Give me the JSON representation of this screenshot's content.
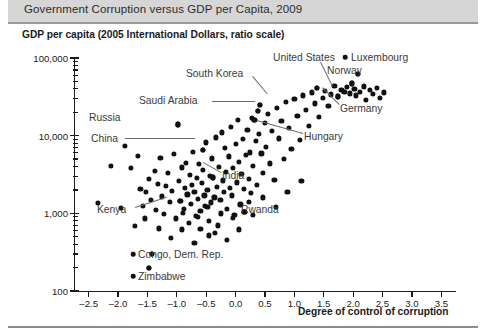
{
  "chart_data": {
    "type": "scatter",
    "title": "Government Corruption versus GDP per Capita, 2009",
    "ylabel": "GDP per capita (2005 International Dollars, ratio scale)",
    "xlabel": "Degree of control of corruption",
    "yscale": "log",
    "xlim": [
      -2.75,
      3.75
    ],
    "ylim": [
      100,
      100000
    ],
    "grid": false,
    "legend": null,
    "xticks": [
      -2.5,
      -2.0,
      -1.5,
      -1.0,
      -0.5,
      0.0,
      0.5,
      1.0,
      1.5,
      2.0,
      2.5,
      3.0,
      3.5
    ],
    "xticklabels": [
      "–2.5",
      "–2.0",
      "–1.5",
      "–1.0",
      "–0.5",
      "0.0",
      "0.5",
      "1.0",
      "1.5",
      "2.0",
      "2.5",
      "3.0",
      "3.5"
    ],
    "yticks": [
      100,
      1000,
      10000,
      100000
    ],
    "yticklabels": [
      "100",
      "1,000",
      "10,000",
      "100,000"
    ],
    "point_color": "#111111",
    "annotation_color": "#3a3a3a",
    "annotations": [
      {
        "label": "United States",
        "x": 1.38,
        "y": 41000,
        "text_x": 273,
        "text_y": 52,
        "leader": [
          321,
          62,
          333,
          86
        ]
      },
      {
        "label": "Luxembourg",
        "x": 2.08,
        "y": 62000,
        "text_x": 351,
        "text_y": 52,
        "leader": null,
        "marker": [
          345,
          57
        ]
      },
      {
        "label": "Norway",
        "x": 1.98,
        "y": 47000,
        "text_x": 327,
        "text_y": 65,
        "leader": null
      },
      {
        "label": "Germany",
        "x": 1.74,
        "y": 32000,
        "text_x": 340,
        "text_y": 103,
        "leader": [
          339,
          105,
          322,
          88
        ]
      },
      {
        "label": "South Korea",
        "x": 0.42,
        "y": 25000,
        "text_x": 186,
        "text_y": 68,
        "leader": [
          253,
          76,
          268,
          94
        ]
      },
      {
        "label": "Saudi Arabia",
        "x": 0.38,
        "y": 21000,
        "text_x": 139,
        "text_y": 95,
        "leader": [
          212,
          101,
          255,
          101
        ]
      },
      {
        "label": "Russia",
        "x": -0.98,
        "y": 14000,
        "text_x": 89,
        "text_y": 112,
        "leader": null
      },
      {
        "label": "China",
        "x": -0.55,
        "y": 6500,
        "text_x": 91,
        "text_y": 133,
        "leader": [
          125,
          138,
          195,
          138
        ]
      },
      {
        "label": "Hungary",
        "x": 0.32,
        "y": 16000,
        "text_x": 304,
        "text_y": 131,
        "leader": [
          303,
          134,
          257,
          121
        ]
      },
      {
        "label": "India",
        "x": -0.38,
        "y": 2900,
        "text_x": 222,
        "text_y": 170,
        "leader": [
          221,
          173,
          203,
          163
        ]
      },
      {
        "label": "Kenya",
        "x": -0.95,
        "y": 1450,
        "text_x": 97,
        "text_y": 204,
        "leader": [
          135,
          207,
          166,
          197
        ]
      },
      {
        "label": "Rwanda",
        "x": 0.15,
        "y": 1050,
        "text_x": 241,
        "text_y": 204,
        "leader": null
      },
      {
        "label": "Congo, Dem. Rep.",
        "x": -1.42,
        "y": 300,
        "text_x": 138,
        "text_y": 249,
        "leader": null,
        "marker": [
          133,
          254
        ]
      },
      {
        "label": "Zimbabwe",
        "x": -1.48,
        "y": 200,
        "text_x": 138,
        "text_y": 271,
        "leader": null,
        "marker": [
          133,
          276
        ]
      }
    ],
    "points": [
      [
        -2.12,
        4100
      ],
      [
        -1.88,
        7400
      ],
      [
        -1.72,
        690
      ],
      [
        -1.62,
        2050
      ],
      [
        -1.58,
        1250
      ],
      [
        -1.52,
        1900
      ],
      [
        -1.48,
        2750
      ],
      [
        -1.44,
        1500
      ],
      [
        -1.42,
        300
      ],
      [
        -1.48,
        200
      ],
      [
        -1.38,
        3500
      ],
      [
        -1.35,
        1120
      ],
      [
        -1.32,
        2400
      ],
      [
        -1.28,
        5200
      ],
      [
        -1.25,
        1650
      ],
      [
        -1.22,
        980
      ],
      [
        -1.18,
        2250
      ],
      [
        -1.15,
        3300
      ],
      [
        -1.12,
        1400
      ],
      [
        -1.08,
        1950
      ],
      [
        -1.05,
        5800
      ],
      [
        -1.02,
        860
      ],
      [
        -0.98,
        14000
      ],
      [
        -0.96,
        2600
      ],
      [
        -0.94,
        1450
      ],
      [
        -0.92,
        3900
      ],
      [
        -0.88,
        1150
      ],
      [
        -0.86,
        2100
      ],
      [
        -0.84,
        4500
      ],
      [
        -0.82,
        1750
      ],
      [
        -0.8,
        760
      ],
      [
        -0.78,
        3100
      ],
      [
        -0.76,
        1320
      ],
      [
        -0.74,
        2300
      ],
      [
        -0.72,
        6200
      ],
      [
        -0.7,
        1880
      ],
      [
        -0.68,
        920
      ],
      [
        -0.66,
        2850
      ],
      [
        -0.64,
        1550
      ],
      [
        -0.62,
        4300
      ],
      [
        -0.6,
        1080
      ],
      [
        -0.58,
        2450
      ],
      [
        -0.56,
        3600
      ],
      [
        -0.55,
        6500
      ],
      [
        -0.53,
        1700
      ],
      [
        -0.52,
        1250
      ],
      [
        -0.5,
        8200
      ],
      [
        -0.48,
        2000
      ],
      [
        -0.46,
        520
      ],
      [
        -0.44,
        3000
      ],
      [
        -0.42,
        1380
      ],
      [
        -0.4,
        5100
      ],
      [
        -0.38,
        2900
      ],
      [
        -0.36,
        1600
      ],
      [
        -0.34,
        9500
      ],
      [
        -0.32,
        2200
      ],
      [
        -0.3,
        700
      ],
      [
        -0.28,
        4000
      ],
      [
        -0.26,
        1480
      ],
      [
        -0.24,
        11000
      ],
      [
        -0.22,
        2650
      ],
      [
        -0.2,
        1900
      ],
      [
        -0.18,
        6900
      ],
      [
        -0.16,
        3400
      ],
      [
        -0.15,
        1150
      ],
      [
        -0.12,
        5400
      ],
      [
        -0.1,
        2150
      ],
      [
        -0.08,
        13000
      ],
      [
        -0.06,
        1700
      ],
      [
        -0.04,
        3800
      ],
      [
        -0.02,
        960
      ],
      [
        0.0,
        7800
      ],
      [
        0.02,
        2500
      ],
      [
        0.04,
        16000
      ],
      [
        0.06,
        4600
      ],
      [
        0.08,
        1300
      ],
      [
        0.1,
        3200
      ],
      [
        0.12,
        9000
      ],
      [
        0.14,
        2050
      ],
      [
        0.15,
        1050
      ],
      [
        0.18,
        5600
      ],
      [
        0.2,
        12000
      ],
      [
        0.22,
        2800
      ],
      [
        0.24,
        6100
      ],
      [
        0.26,
        1850
      ],
      [
        0.28,
        17000
      ],
      [
        0.3,
        4100
      ],
      [
        0.32,
        16000
      ],
      [
        0.34,
        8500
      ],
      [
        0.36,
        2350
      ],
      [
        0.38,
        21000
      ],
      [
        0.4,
        10500
      ],
      [
        0.42,
        25000
      ],
      [
        0.44,
        5900
      ],
      [
        0.46,
        3300
      ],
      [
        0.5,
        14500
      ],
      [
        0.52,
        7200
      ],
      [
        0.55,
        19000
      ],
      [
        0.58,
        4400
      ],
      [
        0.62,
        11500
      ],
      [
        0.66,
        2700
      ],
      [
        0.7,
        23000
      ],
      [
        0.74,
        9200
      ],
      [
        0.78,
        15500
      ],
      [
        0.82,
        5000
      ],
      [
        0.86,
        27000
      ],
      [
        0.9,
        12500
      ],
      [
        0.95,
        6800
      ],
      [
        1.0,
        30000
      ],
      [
        1.05,
        18000
      ],
      [
        1.1,
        8800
      ],
      [
        1.15,
        33000
      ],
      [
        1.2,
        21500
      ],
      [
        1.25,
        13500
      ],
      [
        1.3,
        36000
      ],
      [
        1.35,
        26000
      ],
      [
        1.38,
        41000
      ],
      [
        1.42,
        17500
      ],
      [
        1.48,
        31000
      ],
      [
        1.52,
        38000
      ],
      [
        1.58,
        24000
      ],
      [
        1.62,
        34000
      ],
      [
        1.68,
        44000
      ],
      [
        1.74,
        32000
      ],
      [
        1.8,
        39000
      ],
      [
        1.85,
        36500
      ],
      [
        1.9,
        42000
      ],
      [
        1.95,
        35000
      ],
      [
        1.98,
        47000
      ],
      [
        2.02,
        40000
      ],
      [
        2.05,
        33000
      ],
      [
        2.08,
        62000
      ],
      [
        2.12,
        37000
      ],
      [
        2.18,
        43000
      ],
      [
        2.22,
        29000
      ],
      [
        2.28,
        38500
      ],
      [
        2.34,
        34500
      ],
      [
        2.4,
        41500
      ],
      [
        2.46,
        30500
      ],
      [
        2.52,
        36000
      ],
      [
        -1.95,
        1180
      ],
      [
        -1.78,
        3800
      ],
      [
        -1.66,
        5500
      ],
      [
        -1.55,
        860
      ],
      [
        -1.3,
        640
      ],
      [
        -1.1,
        480
      ],
      [
        -0.9,
        1020
      ],
      [
        -0.7,
        420
      ],
      [
        -0.6,
        630
      ],
      [
        -0.45,
        800
      ],
      [
        -0.35,
        560
      ],
      [
        -0.25,
        1000
      ],
      [
        -0.15,
        460
      ],
      [
        -0.05,
        870
      ],
      [
        0.05,
        620
      ],
      [
        -2.35,
        1350
      ],
      [
        -0.92,
        620
      ],
      [
        -0.64,
        900
      ],
      [
        -0.48,
        1200
      ],
      [
        0.46,
        1600
      ],
      [
        0.68,
        1200
      ],
      [
        0.88,
        1900
      ],
      [
        1.12,
        2600
      ],
      [
        0.3,
        950
      ],
      [
        0.22,
        1400
      ]
    ]
  },
  "page": {
    "title": "Government Corruption versus GDP per Capita, 2009"
  }
}
